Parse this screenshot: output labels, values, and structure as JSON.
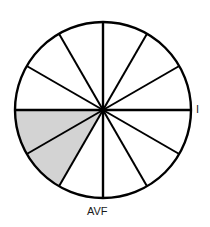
{
  "figure": {
    "name": "hexaxial-reference-circle",
    "background_color": "#ffffff",
    "stroke_color": "#000000",
    "shaded_fill_color": "#d3d3d3",
    "labels": {
      "right_axis": "I",
      "bottom_axis": "AVF"
    }
  },
  "chart_data": {
    "type": "pie",
    "title": "",
    "subtitle": "",
    "xlabel": "",
    "ylabel": "",
    "center_x": 103,
    "center_y": 110,
    "radius": 88,
    "sector_count": 12,
    "sector_span_degrees": 30,
    "grid": false,
    "legend_position": "none",
    "annotations": [
      {
        "text": "I",
        "angle_degrees": 0,
        "position": "right"
      },
      {
        "text": "AVF",
        "angle_degrees": 90,
        "position": "bottom"
      }
    ],
    "categories": [
      "0-30",
      "30-60",
      "60-90",
      "90-120",
      "120-150",
      "150-180",
      "180-210",
      "210-240",
      "240-270",
      "270-300",
      "300-330",
      "330-360"
    ],
    "values": [
      30,
      30,
      30,
      30,
      30,
      30,
      30,
      30,
      30,
      30,
      30,
      30
    ],
    "series": [
      {
        "name": "sectors",
        "values": [
          {
            "start_degrees": 0,
            "end_degrees": 30,
            "shaded": false
          },
          {
            "start_degrees": 30,
            "end_degrees": 60,
            "shaded": false
          },
          {
            "start_degrees": 60,
            "end_degrees": 90,
            "shaded": false
          },
          {
            "start_degrees": 90,
            "end_degrees": 120,
            "shaded": false
          },
          {
            "start_degrees": 120,
            "end_degrees": 150,
            "shaded": true
          },
          {
            "start_degrees": 150,
            "end_degrees": 180,
            "shaded": true
          },
          {
            "start_degrees": 180,
            "end_degrees": 210,
            "shaded": false
          },
          {
            "start_degrees": 210,
            "end_degrees": 240,
            "shaded": false
          },
          {
            "start_degrees": 240,
            "end_degrees": 270,
            "shaded": false
          },
          {
            "start_degrees": 270,
            "end_degrees": 300,
            "shaded": false
          },
          {
            "start_degrees": 300,
            "end_degrees": 330,
            "shaded": false
          },
          {
            "start_degrees": 330,
            "end_degrees": 360,
            "shaded": false
          }
        ]
      }
    ],
    "shaded_sector_indices": [
      4,
      5
    ],
    "shaded_range_degrees": [
      120,
      180
    ]
  }
}
